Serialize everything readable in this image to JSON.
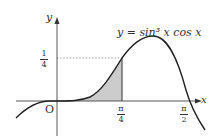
{
  "figure": {
    "equation": "y = sin³ x cos x",
    "axis_x_label": "x",
    "axis_y_label": "y",
    "origin_label": "O",
    "y_tick": {
      "num": "1",
      "den": "4"
    },
    "x_ticks": [
      {
        "num": "π",
        "den": "4"
      },
      {
        "num": "π",
        "den": "2"
      }
    ],
    "shaded_region": "area under curve from 0 to π/4",
    "colors": {
      "curve": "#222222",
      "axis": "#444444",
      "shade": "#cccccc",
      "dotted": "#888888"
    }
  }
}
